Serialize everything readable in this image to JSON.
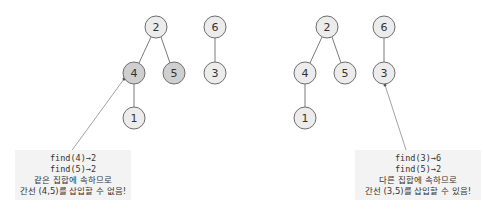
{
  "colors": {
    "node_fill": "#ececec",
    "node_highlight": "#cfcfcf",
    "edge": "#7a7a7a",
    "note_bg": "#f3f3f3"
  },
  "left": {
    "nodes": [
      {
        "id": "2",
        "x": 156,
        "y": 27,
        "hl": false
      },
      {
        "id": "6",
        "x": 215,
        "y": 27,
        "hl": false
      },
      {
        "id": "4",
        "x": 134,
        "y": 73,
        "hl": true
      },
      {
        "id": "5",
        "x": 174,
        "y": 73,
        "hl": true
      },
      {
        "id": "3",
        "x": 215,
        "y": 73,
        "hl": false
      },
      {
        "id": "1",
        "x": 134,
        "y": 118,
        "hl": false
      }
    ],
    "note": {
      "line1": "find(4)→2",
      "line2": "find(5)→2",
      "line3": "같은 집합에 속하므로",
      "line4": "간선 (4,5)를 삽입할 수 없음!"
    }
  },
  "right": {
    "nodes": [
      {
        "id": "2",
        "x": 327,
        "y": 27,
        "hl": false
      },
      {
        "id": "6",
        "x": 384,
        "y": 27,
        "hl": false
      },
      {
        "id": "4",
        "x": 305,
        "y": 73,
        "hl": false
      },
      {
        "id": "5",
        "x": 345,
        "y": 73,
        "hl": false
      },
      {
        "id": "3",
        "x": 384,
        "y": 73,
        "hl": false
      },
      {
        "id": "1",
        "x": 305,
        "y": 118,
        "hl": false
      }
    ],
    "note": {
      "line1": "find(3)→6",
      "line2": "find(5)→2",
      "line3": "다른 집합에 속하므로",
      "line4": "간선 (3,5)를 삽입할 수 있음!"
    }
  }
}
